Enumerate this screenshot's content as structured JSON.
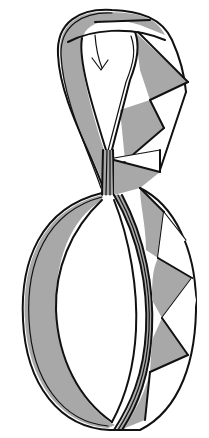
{
  "diagram": {
    "type": "origami-fold-step",
    "colors": {
      "paper_colored_side": "#a8a8a8",
      "paper_white_side": "#ffffff",
      "outline": "#111111"
    },
    "symbols": [
      {
        "name": "fold-arrow",
        "position": "top-loop",
        "direction": "down"
      }
    ],
    "regions": [
      {
        "name": "top-loop"
      },
      {
        "name": "neck"
      },
      {
        "name": "bottom-ring"
      },
      {
        "name": "right-edge-pleats",
        "count": 5
      }
    ]
  }
}
